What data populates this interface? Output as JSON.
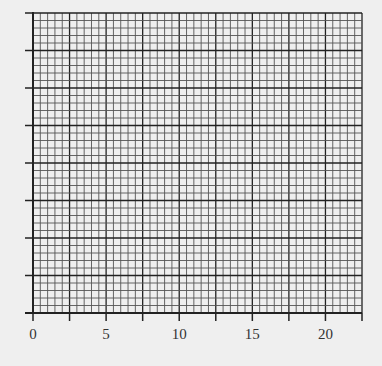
{
  "chart_data": {
    "type": "line",
    "title": "",
    "xlabel": "",
    "ylabel": "",
    "xlim": [
      0,
      22.5
    ],
    "ylim": [
      0,
      8
    ],
    "x_tick_labels": [
      "0",
      "5",
      "10",
      "15",
      "20"
    ],
    "x_tick_values": [
      0,
      5,
      10,
      15,
      20
    ],
    "x_major_tick_step": 2.5,
    "y_major_divisions": 8,
    "y_tick_labels": [],
    "minor_divisions_per_major": 5,
    "grid": true,
    "series": []
  },
  "colors": {
    "background": "#efefef",
    "grid_minor": "#555555",
    "grid_major": "#222222",
    "axis": "#222222",
    "label": "#333333"
  }
}
